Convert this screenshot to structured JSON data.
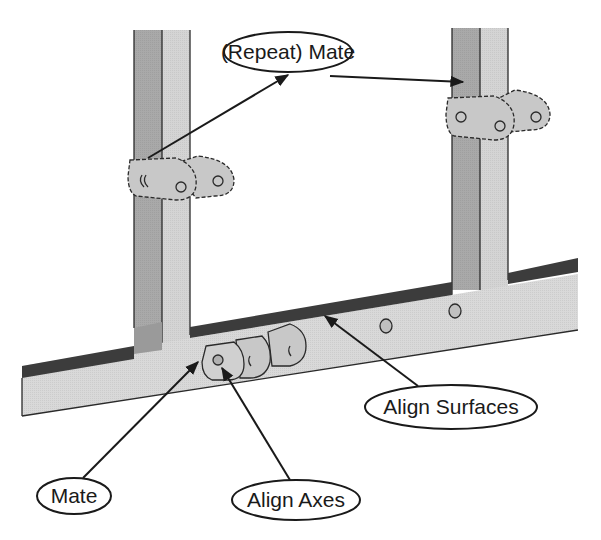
{
  "figure": {
    "colors": {
      "background": "#ffffff",
      "post_shadow_face": "#a9a9a9",
      "post_light_face": "#d4d4d4",
      "beam_front_face": "#d9d9d9",
      "beam_top_face": "#3c3c3c",
      "bracket_face": "#c8c8c8",
      "outline": "#1a1a1a"
    }
  },
  "callouts": [
    {
      "id": "repeat-mate",
      "label": "(Repeat) Mate",
      "targets": [
        "left-post-bracket",
        "right-post-face"
      ]
    },
    {
      "id": "mate",
      "label": "Mate",
      "targets": [
        "beam-bracket-side"
      ]
    },
    {
      "id": "align-axes",
      "label": "Align Axes",
      "targets": [
        "beam-bracket-hole"
      ]
    },
    {
      "id": "align-surfaces",
      "label": "Align Surfaces",
      "targets": [
        "beam-top-surface"
      ]
    }
  ]
}
